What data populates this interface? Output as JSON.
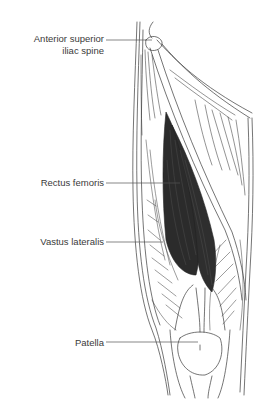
{
  "diagram": {
    "highlight_color": "#2b2b2b",
    "line_color": "#3a3a3a",
    "labels": [
      {
        "id": "asis",
        "lines": [
          "Anterior superior",
          "iliac spine"
        ]
      },
      {
        "id": "rectus_femoris",
        "lines": [
          "Rectus femoris"
        ]
      },
      {
        "id": "vastus_lateralis",
        "lines": [
          "Vastus lateralis"
        ]
      },
      {
        "id": "patella",
        "lines": [
          "Patella"
        ]
      }
    ]
  },
  "labels": {
    "asis_line1": "Anterior superior",
    "asis_line2": "iliac spine",
    "rectus_femoris": "Rectus femoris",
    "vastus_lateralis": "Vastus lateralis",
    "patella": "Patella"
  }
}
